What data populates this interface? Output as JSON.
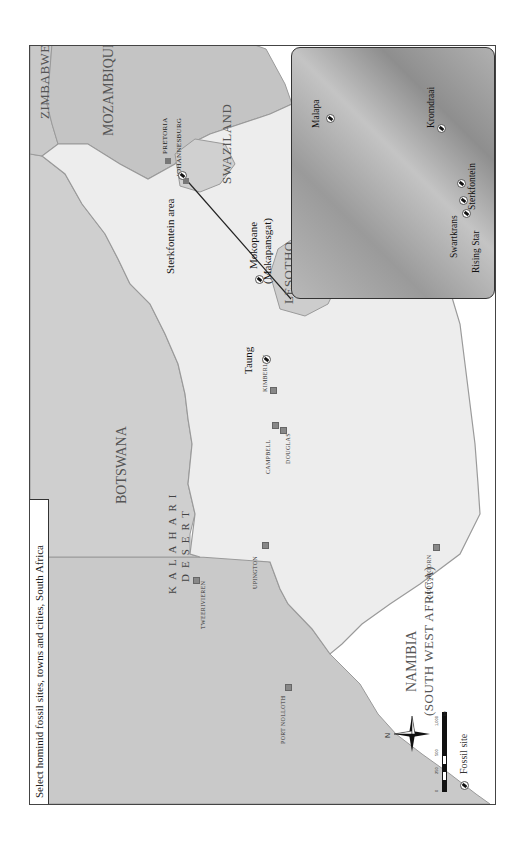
{
  "title": "Select hominid fossil sites, towns and cities, South Africa",
  "countries": {
    "namibia": "NAMIBIA",
    "namibia_sub": "(SOUTH WEST AFRICA)",
    "botswana": "BOTSWANA",
    "zimbabwe": "ZIMBABWE",
    "mozambique": "MOZAMBIQUE",
    "swaziland": "SWAZILAND",
    "lesotho": "LESOTHO"
  },
  "regions": {
    "kalahari_1": "KALAHARI",
    "kalahari_2": "DESERT"
  },
  "cities": {
    "pretoria": "PRETORIA",
    "johannesburg": "JOHANNESBURG"
  },
  "towns": [
    "TWEERIVIEREN",
    "UPINGTON",
    "CAMPBELL",
    "DOUGLAS",
    "KIMBERLEY",
    "OUDTSHOORN",
    "PORT NOLLOTH"
  ],
  "fossil_sites": {
    "mokopane_1": "Mokopane",
    "mokopane_2": "(Makapansgat)",
    "sterkfontein_area": "Sterkfontein area",
    "taung": "Taung"
  },
  "inset_sites": [
    "Malapa",
    "Kromdraai",
    "Sterkfontein",
    "Swartkrans",
    "Rising Star"
  ],
  "legend": {
    "fossil_site": "Fossil site",
    "north": "N",
    "scale_ticks": [
      "0",
      "250",
      "500",
      "1,000"
    ],
    "scale_unit": "km"
  },
  "colors": {
    "south_africa": "#ededed",
    "neighbors": "#c9c9c9",
    "ocean": "#ffffff",
    "border": "#9a9a9a"
  }
}
